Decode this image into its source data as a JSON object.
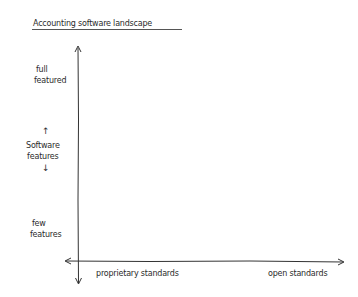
{
  "title": "Accounting software landscape",
  "y_axis": {
    "top_label_line1": "full",
    "top_label_line2": "featured",
    "middle_label_line1": "Software",
    "middle_label_line2": "features",
    "bottom_label_line1": "few",
    "bottom_label_line2": "features",
    "up_arrow": "↑",
    "down_arrow": "↓"
  },
  "x_axis": {
    "left_label": "proprietary standards",
    "right_label": "open standards"
  },
  "colors": {
    "ink": "#2b2b2b",
    "background": "#ffffff"
  }
}
